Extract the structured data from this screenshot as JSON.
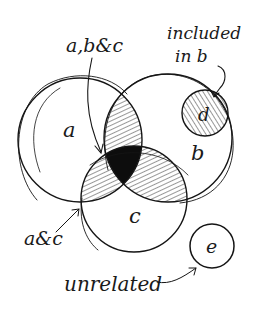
{
  "diagram": {
    "type": "venn",
    "style": "hand-drawn ink sketch",
    "colors": {
      "ink": "#151515",
      "background": "#ffffff",
      "triple_intersection_fill": "#0d0d0d"
    },
    "sets": [
      {
        "id": "a",
        "label": "a"
      },
      {
        "id": "b",
        "label": "b"
      },
      {
        "id": "c",
        "label": "c"
      },
      {
        "id": "d",
        "label": "d"
      },
      {
        "id": "e",
        "label": "e"
      }
    ],
    "annotations": [
      {
        "id": "abc",
        "text": "a,b&c"
      },
      {
        "id": "included",
        "line1": "included",
        "line2": "in b"
      },
      {
        "id": "ac",
        "text": "a&c"
      },
      {
        "id": "unrelated",
        "text": "unrelated"
      }
    ],
    "regions": [
      {
        "sets": [
          "a",
          "b"
        ],
        "fill": "hatched"
      },
      {
        "sets": [
          "b",
          "c"
        ],
        "fill": "hatched"
      },
      {
        "sets": [
          "a",
          "c"
        ],
        "fill": "hatched"
      },
      {
        "sets": [
          "a",
          "b",
          "c"
        ],
        "fill": "solid black"
      },
      {
        "sets": [
          "d"
        ],
        "fill": "hatched",
        "note": "subset of b"
      },
      {
        "sets": [
          "e"
        ],
        "fill": "none",
        "note": "disjoint from all"
      }
    ]
  }
}
